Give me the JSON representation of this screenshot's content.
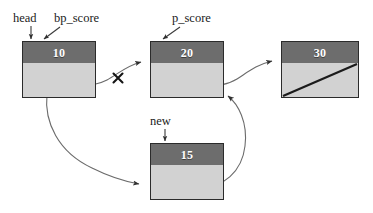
{
  "diagram": {
    "background_color": "#ffffff",
    "node_header_color": "#6d6d6d",
    "node_body_color": "#d2d2d2",
    "node_border_color": "#2b2b2b",
    "node_value_color": "#ffffff",
    "edge_color": "#5a5a5a",
    "label_color": "#1b1b1b",
    "nodes": [
      {
        "id": "node-10",
        "value": "10",
        "x": 22,
        "y": 41,
        "width": 74,
        "height": 57,
        "header_height": 22,
        "null_slash": false
      },
      {
        "id": "node-20",
        "value": "20",
        "x": 150,
        "y": 41,
        "width": 74,
        "height": 57,
        "header_height": 22,
        "null_slash": false
      },
      {
        "id": "node-30",
        "value": "30",
        "x": 281,
        "y": 41,
        "width": 78,
        "height": 57,
        "header_height": 22,
        "null_slash": true
      },
      {
        "id": "node-15",
        "value": "15",
        "x": 150,
        "y": 143,
        "width": 74,
        "height": 57,
        "header_height": 22,
        "null_slash": false
      }
    ],
    "pointer_labels": [
      {
        "id": "label-head",
        "text": "head",
        "x": 13,
        "y": 12
      },
      {
        "id": "label-bp-score",
        "text": "bp_score",
        "x": 54,
        "y": 12
      },
      {
        "id": "label-p-score",
        "text": "p_score",
        "x": 172,
        "y": 12
      },
      {
        "id": "label-new",
        "text": "new",
        "x": 150,
        "y": 115
      }
    ],
    "edges": [
      {
        "id": "edge-head-to-node10",
        "from": "head",
        "to": "node-10",
        "kind": "label-pointer"
      },
      {
        "id": "edge-bpscore-to-node10",
        "from": "bp_score",
        "to": "node-10",
        "kind": "label-pointer"
      },
      {
        "id": "edge-pscore-to-node20",
        "from": "p_score",
        "to": "node-20",
        "kind": "label-pointer"
      },
      {
        "id": "edge-new-to-node15",
        "from": "new",
        "to": "node-15",
        "kind": "label-pointer"
      },
      {
        "id": "edge-node10-to-node20",
        "from": "node-10",
        "to": "node-20",
        "kind": "severed",
        "marker": "x"
      },
      {
        "id": "edge-node20-to-node30",
        "from": "node-20",
        "to": "node-30",
        "kind": "next"
      },
      {
        "id": "edge-node10-to-node15",
        "from": "node-10",
        "to": "node-15",
        "kind": "next"
      },
      {
        "id": "edge-node15-to-node20",
        "from": "node-15",
        "to": "node-20",
        "kind": "next"
      }
    ],
    "severed_marker": {
      "id": "severed-x-marker",
      "symbol": "X",
      "x": 118,
      "y": 78
    }
  }
}
